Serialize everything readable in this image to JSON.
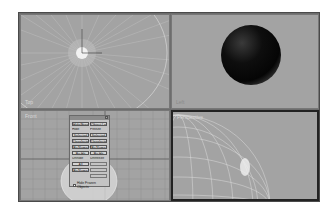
{
  "viewports": [
    {
      "id": "top-left",
      "label": "Top",
      "content": "wireframe-grid-with-light-and-gizmo"
    },
    {
      "id": "top-right",
      "label": "Left",
      "content": "shaded-sphere"
    },
    {
      "id": "bottom-left",
      "label": "Front",
      "content": "grid-with-floating-panel"
    },
    {
      "id": "bottom-right",
      "label": "Perspective",
      "content": "wireframe-sphere",
      "active": true
    }
  ],
  "colors": {
    "viewport_bg": "#a3a3a3",
    "grid_line": "#c8c8c8",
    "sphere_dark": "#080808",
    "active_border": "#222222"
  },
  "panel": {
    "tabs": [
      "Hide/Freeze",
      "Object Level"
    ],
    "hide_label": "Hide",
    "freeze_label": "Freeze",
    "buttons_left": [
      "Selected",
      "Unselected",
      "By Name",
      "By Hit"
    ],
    "buttons_right": [
      "Selected",
      "Unselected",
      "By Name",
      "By Hit"
    ],
    "unhide_label": "Unhide",
    "unfreeze_label": "Unfreeze",
    "unhide_buttons": [
      "All",
      "By Name"
    ],
    "checkbox_label": "Hide Frozen Objects"
  }
}
